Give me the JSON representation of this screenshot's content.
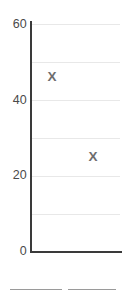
{
  "chart_data": {
    "type": "scatter",
    "title": "",
    "subtitle": "",
    "xlabel": "",
    "ylabel": "",
    "ylim": [
      0,
      60
    ],
    "ytick_labels": [
      "60",
      "40",
      "20",
      "0"
    ],
    "ytick_values": [
      60,
      40,
      20,
      0
    ],
    "gridlines": {
      "visible": true,
      "orientation": "horizontal",
      "values": [
        60,
        50,
        40,
        30,
        20,
        10
      ],
      "color": "#e8e8e8"
    },
    "grid": true,
    "legend": null,
    "marker_symbol": "X",
    "marker_color": "#6e6e6e",
    "axis_color": "#3a3a3a",
    "tick_label_color": "#4a4a4a",
    "series": [
      {
        "name": "",
        "marker": "X",
        "points": [
          {
            "label": "",
            "x": 1,
            "y": 46
          },
          {
            "label": "",
            "x": 2,
            "y": 25
          }
        ]
      }
    ],
    "x_axis_visible": true,
    "x_tick_labels": []
  },
  "bottom_rules": [
    {
      "name": "rule-left",
      "color": "#9a9a9a"
    },
    {
      "name": "rule-right",
      "color": "#9a9a9a"
    }
  ]
}
